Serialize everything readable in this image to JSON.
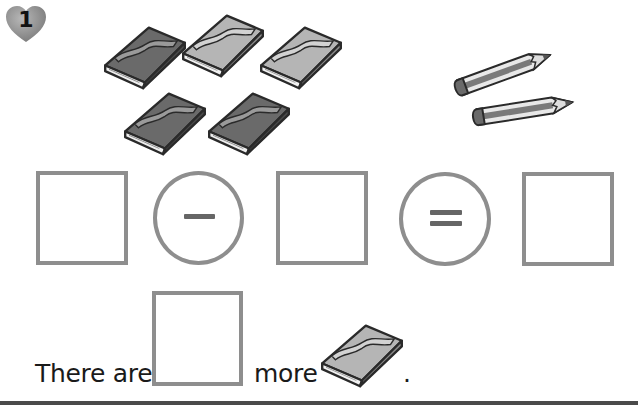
{
  "exercise": {
    "number": "1",
    "badge_shape": "heart",
    "badge_color": "#8a8a8a"
  },
  "pictures": {
    "books": {
      "count": 5,
      "icon": "book-icon",
      "items": [
        {
          "shade": "dark"
        },
        {
          "shade": "light"
        },
        {
          "shade": "light"
        },
        {
          "shade": "dark"
        },
        {
          "shade": "dark"
        }
      ]
    },
    "pencils": {
      "count": 2,
      "icon": "pencil-icon"
    }
  },
  "equation": {
    "operand1": "",
    "operator": "−",
    "operator_name": "minus",
    "operand2": "",
    "equals": "=",
    "result": ""
  },
  "sentence": {
    "prefix": "There are",
    "answer": "",
    "middle": "more",
    "object_icon": "book-icon",
    "suffix": "."
  },
  "colors": {
    "box_border": "#8e8e8e",
    "book_dark": "#6a6a6a",
    "book_light": "#b5b5b5",
    "rule": "#4a4a4a"
  }
}
